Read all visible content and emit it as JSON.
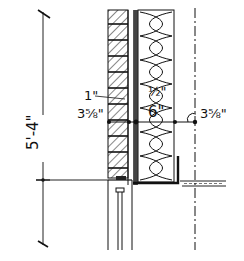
{
  "drawing": {
    "type": "architectural wall section sketch",
    "overall_height_label": "5'-4\"",
    "dimensions": {
      "air_space": "1\"",
      "masonry_left": "3 5/8\"",
      "sheathing": "1/2\"",
      "stud_insulation": "6\"",
      "interior_offset_right": "3 5/8\""
    },
    "labels": {
      "masonry_left_display": "3⅝\"",
      "interior_right_display": "3⅝\"",
      "air_space_display": "1\"",
      "sheathing_display": "½\"",
      "stud_display": "6\""
    },
    "components": [
      "brick veneer (hatched)",
      "air space",
      "sheathing",
      "batt insulation",
      "window head / frame",
      "floor line",
      "centerline"
    ],
    "colors": {
      "ink": "#111111",
      "paper": "#ffffff"
    }
  }
}
